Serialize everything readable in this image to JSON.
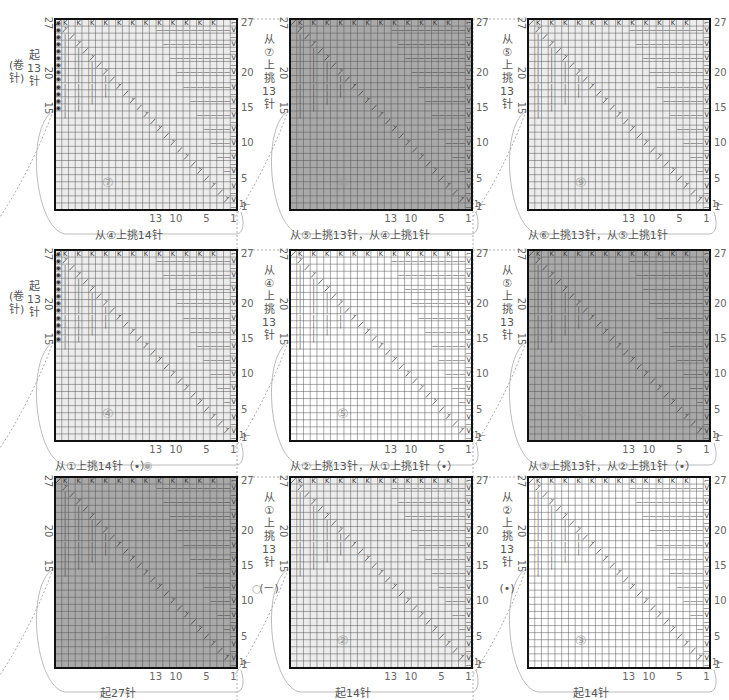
{
  "diagram": {
    "type": "knitting-chart-grid",
    "grid_cols": 27,
    "grid_rows": 27,
    "row_labels": [
      "27",
      "20",
      "15",
      "10",
      "5",
      "1"
    ],
    "col_labels": [
      "13",
      "10",
      "5",
      "1"
    ],
    "colors": {
      "dark_fill": "#a9a9a9",
      "medium_fill": "#c6c6c6",
      "light_fill": "#ececec",
      "white_fill": "#ffffff",
      "border": "#111111",
      "grid_line": "#555555",
      "symbol": "#333333",
      "guide": "#999999"
    },
    "symbols": {
      "top_row": "K",
      "upper_left": "|",
      "lower_right": "—",
      "right_col": "V",
      "diagonal": "⋌",
      "corner_left": "◉"
    },
    "charts": [
      {
        "id": "7",
        "number": "⑦",
        "x": 55,
        "y": 19,
        "fill": "light",
        "cast_on_mark": true,
        "caption": "从④上挑14针",
        "side_text": [
          "起",
          "13",
          "针"
        ],
        "side_paren": "(卷针)",
        "num_label": "⑦"
      },
      {
        "id": "8",
        "number": "⑧",
        "x": 290,
        "y": 19,
        "fill": "dark",
        "cast_on_mark": false,
        "caption": "从⑤上挑13针，从④上挑1针",
        "side_text": [
          "从",
          "⑦",
          "上",
          "挑",
          "13",
          "针"
        ],
        "side_paren": "",
        "num_label": "⑧"
      },
      {
        "id": "9",
        "number": "⑨",
        "x": 528,
        "y": 19,
        "fill": "light",
        "cast_on_mark": false,
        "caption": "从⑥上挑13针，从⑤上挑1针",
        "side_text": [
          "从",
          "⑤",
          "上",
          "挑",
          "13",
          "针"
        ],
        "side_paren": "",
        "num_label": "⑨"
      },
      {
        "id": "4",
        "number": "④",
        "x": 55,
        "y": 250,
        "fill": "light",
        "cast_on_mark": true,
        "caption": "从①上挑14针（•）",
        "side_text": [
          "起",
          "13",
          "针"
        ],
        "side_paren": "(卷针)",
        "num_label": "④"
      },
      {
        "id": "5",
        "number": "⑤",
        "x": 290,
        "y": 250,
        "fill": "white",
        "cast_on_mark": false,
        "caption": "从②上挑13针，从①上挑1针（•）",
        "side_text": [
          "从",
          "④",
          "上",
          "挑",
          "13",
          "针"
        ],
        "side_paren": "",
        "num_label": "⑤"
      },
      {
        "id": "6",
        "number": "⑥",
        "x": 528,
        "y": 250,
        "fill": "dark",
        "cast_on_mark": false,
        "caption": "从③上挑13针，从②上挑1针（•）",
        "side_text": [
          "从",
          "⑤",
          "上",
          "挑",
          "13",
          "针"
        ],
        "side_paren": "",
        "num_label": "⑥"
      },
      {
        "id": "1",
        "number": "①",
        "x": 55,
        "y": 477,
        "fill": "dark",
        "cast_on_mark": false,
        "caption": "起27针",
        "side_text": [],
        "side_paren": "",
        "num_label": "①"
      },
      {
        "id": "2",
        "number": "②",
        "x": 290,
        "y": 477,
        "fill": "light",
        "cast_on_mark": false,
        "caption": "起14针",
        "side_text": [
          "从",
          "①",
          "上",
          "挑",
          "13",
          "针"
        ],
        "side_paren": "(－)",
        "num_label": "②"
      },
      {
        "id": "3",
        "number": "③",
        "x": 528,
        "y": 477,
        "fill": "white",
        "cast_on_mark": false,
        "caption": "起14针",
        "side_text": [
          "从",
          "②",
          "上",
          "挑",
          "13",
          "针"
        ],
        "side_paren": "(•)",
        "num_label": "③"
      }
    ],
    "connector_marks": {
      "between_4_and_1": "◉",
      "left_of_2": "○"
    },
    "direction_arrows": {
      "row1": "1←",
      "row2": "→"
    }
  }
}
